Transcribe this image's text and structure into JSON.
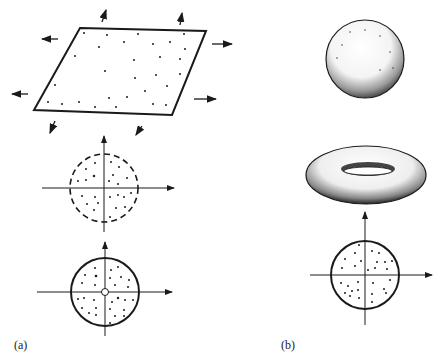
{
  "figure": {
    "panel_a_label": "(a)",
    "panel_b_label": "(b)",
    "colors": {
      "ink": "#1a1a1a",
      "background": "#ffffff"
    },
    "panel_a": {
      "items": [
        "stretched-plane-with-arrows",
        "dashed-disk-with-axes",
        "punctured-disk-with-axes"
      ]
    },
    "panel_b": {
      "items": [
        "sphere",
        "torus",
        "disk-with-axes"
      ]
    }
  }
}
